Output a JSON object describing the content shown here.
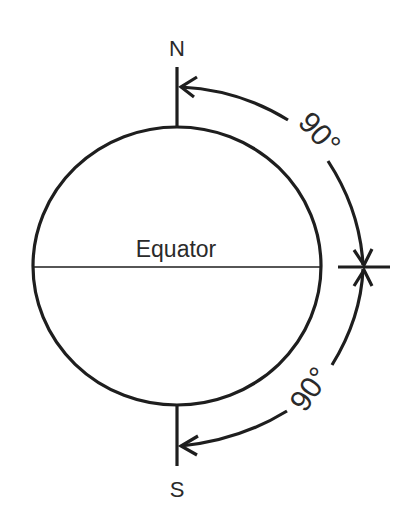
{
  "diagram": {
    "type": "globe-latitude-diagram",
    "labels": {
      "north": "N",
      "south": "S",
      "equator": "Equator",
      "angle_upper": "90°",
      "angle_lower": "90°"
    },
    "colors": {
      "line": "#1e1e1e",
      "text": "#2a2a2a",
      "background": "#ffffff"
    }
  }
}
